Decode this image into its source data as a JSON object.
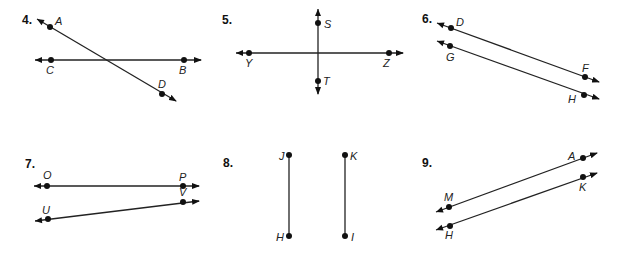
{
  "problems": [
    {
      "number": "4.",
      "number_pos": [
        22,
        24
      ],
      "lines": [
        {
          "from": [
            37,
            19
          ],
          "to": [
            176,
            101
          ],
          "arrow_start": true,
          "arrow_end": true
        },
        {
          "from": [
            35,
            60
          ],
          "to": [
            201,
            60
          ],
          "arrow_start": true,
          "arrow_end": true
        }
      ],
      "points": [
        {
          "label": "A",
          "dot": [
            50,
            27
          ],
          "label_pos": [
            55,
            25
          ]
        },
        {
          "label": "D",
          "dot": [
            162,
            94
          ],
          "label_pos": [
            158,
            88
          ]
        },
        {
          "label": "C",
          "dot": [
            51,
            60
          ],
          "label_pos": [
            46,
            74
          ]
        },
        {
          "label": "B",
          "dot": [
            184,
            60
          ],
          "label_pos": [
            179,
            74
          ]
        }
      ]
    },
    {
      "number": "5.",
      "number_pos": [
        222,
        24
      ],
      "lines": [
        {
          "from": [
            318,
            9
          ],
          "to": [
            318,
            94
          ],
          "arrow_start": true,
          "arrow_end": true
        },
        {
          "from": [
            236,
            53
          ],
          "to": [
            403,
            53
          ],
          "arrow_start": true,
          "arrow_end": true
        }
      ],
      "points": [
        {
          "label": "S",
          "dot": [
            318,
            23
          ],
          "label_pos": [
            324,
            28
          ]
        },
        {
          "label": "T",
          "dot": [
            318,
            81
          ],
          "label_pos": [
            323,
            85
          ]
        },
        {
          "label": "Y",
          "dot": [
            249,
            53
          ],
          "label_pos": [
            245,
            67
          ]
        },
        {
          "label": "Z",
          "dot": [
            389,
            53
          ],
          "label_pos": [
            383,
            67
          ]
        }
      ]
    },
    {
      "number": "6.",
      "number_pos": [
        422,
        23
      ],
      "lines": [
        {
          "from": [
            437,
            23
          ],
          "to": [
            599,
            82
          ],
          "arrow_start": true,
          "arrow_end": true
        },
        {
          "from": [
            437,
            41
          ],
          "to": [
            599,
            99
          ],
          "arrow_start": true,
          "arrow_end": true
        }
      ],
      "points": [
        {
          "label": "D",
          "dot": [
            451,
            28
          ],
          "label_pos": [
            456,
            26
          ]
        },
        {
          "label": "F",
          "dot": [
            585,
            77
          ],
          "label_pos": [
            582,
            72
          ]
        },
        {
          "label": "G",
          "dot": [
            450,
            46
          ],
          "label_pos": [
            446,
            61
          ]
        },
        {
          "label": "H",
          "dot": [
            584,
            95
          ],
          "label_pos": [
            568,
            103
          ]
        }
      ]
    },
    {
      "number": "7.",
      "number_pos": [
        25,
        168
      ],
      "lines": [
        {
          "from": [
            34,
            186
          ],
          "to": [
            199,
            186
          ],
          "arrow_start": true,
          "arrow_end": true
        },
        {
          "from": [
            35,
            221
          ],
          "to": [
            199,
            201
          ],
          "arrow_start": true,
          "arrow_end": true
        }
      ],
      "points": [
        {
          "label": "O",
          "dot": [
            47,
            186
          ],
          "label_pos": [
            43,
            179
          ]
        },
        {
          "label": "P",
          "dot": [
            183,
            186
          ],
          "label_pos": [
            179,
            181
          ]
        },
        {
          "label": "V",
          "dot": [
            183,
            202
          ],
          "label_pos": [
            179,
            196
          ]
        },
        {
          "label": "U",
          "dot": [
            48,
            219
          ],
          "label_pos": [
            42,
            214
          ]
        }
      ]
    },
    {
      "number": "8.",
      "number_pos": [
        223,
        167
      ],
      "lines": [
        {
          "from": [
            289,
            155
          ],
          "to": [
            289,
            236
          ],
          "arrow_start": false,
          "arrow_end": false
        },
        {
          "from": [
            345,
            155
          ],
          "to": [
            345,
            236
          ],
          "arrow_start": false,
          "arrow_end": false
        }
      ],
      "points": [
        {
          "label": "J",
          "dot": [
            289,
            155
          ],
          "label_pos": [
            279,
            160
          ]
        },
        {
          "label": "K",
          "dot": [
            345,
            155
          ],
          "label_pos": [
            350,
            160
          ]
        },
        {
          "label": "H",
          "dot": [
            289,
            236
          ],
          "label_pos": [
            276,
            241
          ]
        },
        {
          "label": "I",
          "dot": [
            345,
            236
          ],
          "label_pos": [
            351,
            241
          ]
        }
      ]
    },
    {
      "number": "9.",
      "number_pos": [
        422,
        167
      ],
      "lines": [
        {
          "from": [
            436,
            212
          ],
          "to": [
            597,
            153
          ],
          "arrow_start": true,
          "arrow_end": true
        },
        {
          "from": [
            436,
            230
          ],
          "to": [
            597,
            173
          ],
          "arrow_start": true,
          "arrow_end": true
        }
      ],
      "points": [
        {
          "label": "A",
          "dot": [
            583,
            158
          ],
          "label_pos": [
            568,
            160
          ]
        },
        {
          "label": "M",
          "dot": [
            449,
            207
          ],
          "label_pos": [
            444,
            201
          ]
        },
        {
          "label": "K",
          "dot": [
            583,
            177
          ],
          "label_pos": [
            579,
            191
          ]
        },
        {
          "label": "H",
          "dot": [
            450,
            226
          ],
          "label_pos": [
            445,
            239
          ]
        }
      ]
    }
  ]
}
